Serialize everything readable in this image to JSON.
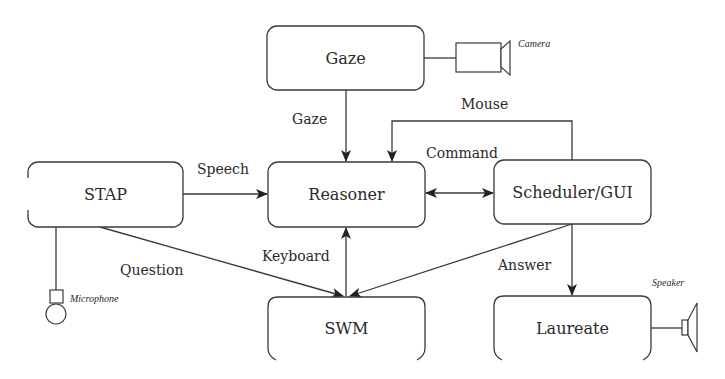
{
  "diagram": {
    "nodes": [
      {
        "id": "gaze",
        "label": "Gaze"
      },
      {
        "id": "stap",
        "label": "STAP"
      },
      {
        "id": "reasoner",
        "label": "Reasoner"
      },
      {
        "id": "scheduler",
        "label": "Scheduler/GUI"
      },
      {
        "id": "swm",
        "label": "SWM"
      },
      {
        "id": "laureate",
        "label": "Laureate"
      }
    ],
    "devices": [
      {
        "id": "camera",
        "label": "Camera",
        "attached_to": "gaze"
      },
      {
        "id": "microphone",
        "label": "Microphone",
        "attached_to": "stap"
      },
      {
        "id": "speaker",
        "label": "Speaker",
        "attached_to": "laureate"
      }
    ],
    "edges": [
      {
        "from": "gaze",
        "to": "reasoner",
        "label": "Gaze"
      },
      {
        "from": "stap",
        "to": "reasoner",
        "label": "Speech"
      },
      {
        "from": "scheduler",
        "to": "reasoner",
        "label": "Mouse"
      },
      {
        "from": "reasoner",
        "to": "scheduler",
        "label": "Command",
        "bidirectional": true
      },
      {
        "from": "swm",
        "to": "reasoner",
        "label": "Keyboard",
        "bidirectional": true
      },
      {
        "from": "stap",
        "to": "swm",
        "label": "Question"
      },
      {
        "from": "scheduler",
        "to": "swm",
        "label": ""
      },
      {
        "from": "scheduler",
        "to": "laureate",
        "label": "Answer"
      }
    ]
  }
}
